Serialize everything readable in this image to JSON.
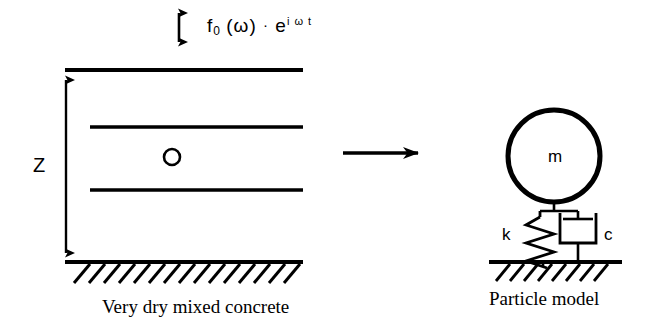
{
  "figure": {
    "background_color": "#ffffff",
    "line_color": "#000000"
  },
  "excitation": {
    "arrow_name": "vertical-double-arrow",
    "formula": {
      "base": "f",
      "subscript": "0",
      "argument": "(ω)",
      "operator": "·",
      "exponential_base": "e",
      "exponent": "i ω t",
      "full_text": "f 0 (ω) · e iωt"
    }
  },
  "left_model": {
    "dimension_label": "Z",
    "caption": "Very dry mixed concrete",
    "particle_marker": "o",
    "layer_count": 4,
    "ground_hatch": "hatched-fixed-base"
  },
  "transition": {
    "arrow_label": "",
    "arrow_name": "rightward-transition-arrow"
  },
  "right_model": {
    "caption": "Particle model",
    "mass_label": "m",
    "spring_label": "k",
    "damper_label": "c",
    "ground_hatch": "hatched-fixed-base"
  }
}
